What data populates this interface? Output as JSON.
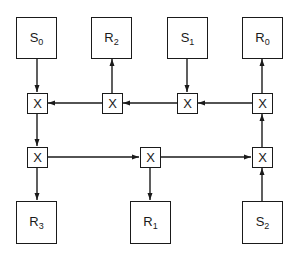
{
  "diagram": {
    "type": "crossbar-switch-network",
    "senders": [
      {
        "id": "S0",
        "name": "S",
        "sub": "0"
      },
      {
        "id": "S1",
        "name": "S",
        "sub": "1"
      },
      {
        "id": "S2",
        "name": "S",
        "sub": "2"
      }
    ],
    "receivers": [
      {
        "id": "R0",
        "name": "R",
        "sub": "0"
      },
      {
        "id": "R1",
        "name": "R",
        "sub": "1"
      },
      {
        "id": "R2",
        "name": "R",
        "sub": "2"
      },
      {
        "id": "R3",
        "name": "R",
        "sub": "3"
      }
    ],
    "top_row": [
      {
        "id": "S0",
        "name": "S",
        "sub": "0"
      },
      {
        "id": "R2",
        "name": "R",
        "sub": "2"
      },
      {
        "id": "S1",
        "name": "S",
        "sub": "1"
      },
      {
        "id": "R0",
        "name": "R",
        "sub": "0"
      }
    ],
    "bottom_row": [
      {
        "id": "R3",
        "name": "R",
        "sub": "3"
      },
      {
        "id": "R1",
        "name": "R",
        "sub": "1"
      },
      {
        "id": "S2",
        "name": "S",
        "sub": "2"
      }
    ],
    "switch_label": "X",
    "switches": {
      "upper": [
        "X",
        "X",
        "X",
        "X"
      ],
      "lower": [
        "X",
        "X",
        "X"
      ]
    },
    "edges": [
      [
        "S0",
        "X_upper_0"
      ],
      [
        "X_upper_1",
        "R2"
      ],
      [
        "S1",
        "X_upper_2"
      ],
      [
        "X_upper_3",
        "R0"
      ],
      [
        "X_upper_3",
        "X_upper_2"
      ],
      [
        "X_upper_2",
        "X_upper_1"
      ],
      [
        "X_upper_1",
        "X_upper_0"
      ],
      [
        "X_upper_0",
        "X_lower_0"
      ],
      [
        "X_lower_0",
        "R3"
      ],
      [
        "X_lower_0",
        "X_lower_1"
      ],
      [
        "X_lower_1",
        "R1"
      ],
      [
        "X_lower_1",
        "X_lower_2"
      ],
      [
        "S2",
        "X_lower_2"
      ],
      [
        "X_lower_2",
        "X_upper_3"
      ]
    ],
    "line_color": "#1a1a1a"
  }
}
